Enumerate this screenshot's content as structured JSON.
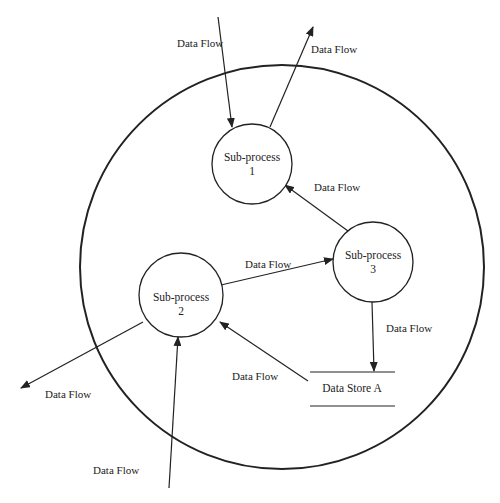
{
  "diagram": {
    "type": "data-flow-diagram",
    "boundary": {
      "cx": 282,
      "cy": 267,
      "r": 202
    },
    "processes": [
      {
        "id": "p1",
        "title": "Sub-process",
        "number": "1",
        "cx": 252,
        "cy": 164,
        "r": 40
      },
      {
        "id": "p2",
        "title": "Sub-process",
        "number": "2",
        "cx": 181,
        "cy": 295,
        "r": 42
      },
      {
        "id": "p3",
        "title": "Sub-process",
        "number": "3",
        "cx": 373,
        "cy": 262,
        "r": 40
      }
    ],
    "data_store": {
      "label": "Data Store A"
    },
    "flows": [
      {
        "label": "Data Flow",
        "from": "external",
        "to": "Sub-process 1"
      },
      {
        "label": "Data Flow",
        "from": "Sub-process 1",
        "to": "external"
      },
      {
        "label": "Data Flow",
        "from": "Sub-process 3",
        "to": "Sub-process 1"
      },
      {
        "label": "Data Flow",
        "from": "Sub-process 2",
        "to": "Sub-process 3"
      },
      {
        "label": "Data Flow",
        "from": "Sub-process 3",
        "to": "Data Store A"
      },
      {
        "label": "Data Flow",
        "from": "Data Store A",
        "to": "Sub-process 2"
      },
      {
        "label": "Data Flow",
        "from": "Sub-process 2",
        "to": "external"
      },
      {
        "label": "Data Flow",
        "from": "external",
        "to": "Sub-process 2"
      }
    ]
  }
}
